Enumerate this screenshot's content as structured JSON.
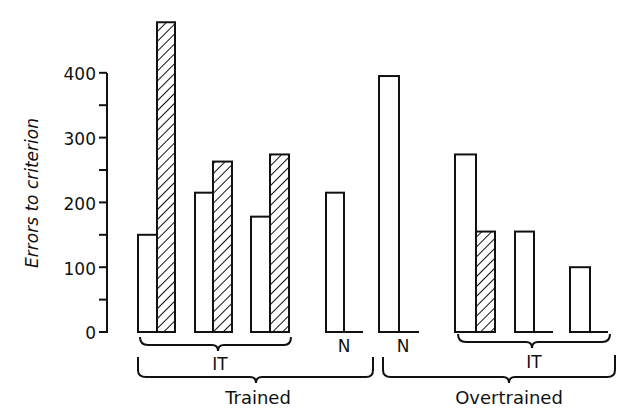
{
  "chart_data": {
    "type": "bar",
    "title": "",
    "xlabel": "",
    "ylabel": "Errors to criterion",
    "ylim": [
      0,
      400
    ],
    "yticks": [
      0,
      100,
      200,
      300,
      400
    ],
    "minor_yticks": [
      50,
      150,
      250,
      350
    ],
    "grid": false,
    "legend": null,
    "series_styles": {
      "open": "white fill (open bar)",
      "hatched": "diagonal hatch fill"
    },
    "groups": [
      {
        "label": "Trained",
        "subgroups": [
          {
            "label": "IT",
            "pairs": [
              {
                "open": 150,
                "hatched": 478
              },
              {
                "open": 215,
                "hatched": 263
              },
              {
                "open": 178,
                "hatched": 274
              }
            ]
          },
          {
            "label": "N",
            "pairs": [
              {
                "open": 215,
                "hatched": 0
              }
            ]
          }
        ]
      },
      {
        "label": "Overtrained",
        "subgroups": [
          {
            "label": "N",
            "pairs": [
              {
                "open": 395,
                "hatched": 0
              }
            ]
          },
          {
            "label": "IT",
            "pairs": [
              {
                "open": 274,
                "hatched": 155
              },
              {
                "open": 155,
                "hatched": 0
              },
              {
                "open": 100,
                "hatched": 0
              }
            ]
          }
        ]
      }
    ],
    "bars": [
      {
        "group": "Trained",
        "subgroup": "IT",
        "pair": 1,
        "fill": "open",
        "value": 150
      },
      {
        "group": "Trained",
        "subgroup": "IT",
        "pair": 1,
        "fill": "hatched",
        "value": 478
      },
      {
        "group": "Trained",
        "subgroup": "IT",
        "pair": 2,
        "fill": "open",
        "value": 215
      },
      {
        "group": "Trained",
        "subgroup": "IT",
        "pair": 2,
        "fill": "hatched",
        "value": 263
      },
      {
        "group": "Trained",
        "subgroup": "IT",
        "pair": 3,
        "fill": "open",
        "value": 178
      },
      {
        "group": "Trained",
        "subgroup": "IT",
        "pair": 3,
        "fill": "hatched",
        "value": 274
      },
      {
        "group": "Trained",
        "subgroup": "N",
        "pair": 1,
        "fill": "open",
        "value": 215
      },
      {
        "group": "Overtrained",
        "subgroup": "N",
        "pair": 1,
        "fill": "open",
        "value": 395
      },
      {
        "group": "Overtrained",
        "subgroup": "IT",
        "pair": 1,
        "fill": "open",
        "value": 274
      },
      {
        "group": "Overtrained",
        "subgroup": "IT",
        "pair": 1,
        "fill": "hatched",
        "value": 155
      },
      {
        "group": "Overtrained",
        "subgroup": "IT",
        "pair": 2,
        "fill": "open",
        "value": 155
      },
      {
        "group": "Overtrained",
        "subgroup": "IT",
        "pair": 3,
        "fill": "open",
        "value": 100
      }
    ]
  },
  "axis": {
    "ylabel": "Errors to criterion",
    "ticks": [
      "0",
      "100",
      "200",
      "300",
      "400"
    ]
  },
  "labels": {
    "trained_it": "IT",
    "trained_n": "N",
    "overtrained_n": "N",
    "overtrained_it": "IT",
    "trained": "Trained",
    "overtrained": "Overtrained"
  },
  "layout": {
    "baseline_y": 332,
    "px_per_unit": 0.648,
    "bar_geometry": [
      {
        "x": 138,
        "w": 19,
        "fill": "open",
        "idx": 0,
        "baseline_end": 157
      },
      {
        "x": 157,
        "w": 18,
        "fill": "hatched",
        "idx": 1
      },
      {
        "x": 195,
        "w": 18,
        "fill": "open",
        "idx": 2
      },
      {
        "x": 213,
        "w": 19,
        "fill": "hatched",
        "idx": 3
      },
      {
        "x": 251,
        "w": 19,
        "fill": "open",
        "idx": 4
      },
      {
        "x": 270,
        "w": 19,
        "fill": "hatched",
        "idx": 5
      },
      {
        "x": 326,
        "w": 18,
        "fill": "open",
        "idx": 6,
        "baseline_end": 363
      },
      {
        "x": 379,
        "w": 20,
        "fill": "open",
        "idx": 7,
        "baseline_end": 419
      },
      {
        "x": 455,
        "w": 21,
        "fill": "open",
        "idx": 8
      },
      {
        "x": 476,
        "w": 19,
        "fill": "hatched",
        "idx": 9
      },
      {
        "x": 515,
        "w": 19,
        "fill": "open",
        "idx": 10,
        "baseline_end": 553
      },
      {
        "x": 570,
        "w": 20,
        "fill": "open",
        "idx": 11,
        "baseline_end": 608
      }
    ]
  }
}
